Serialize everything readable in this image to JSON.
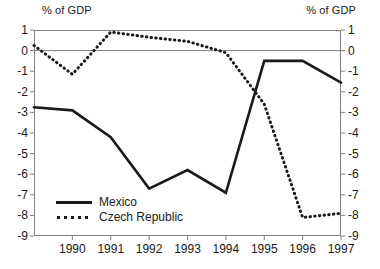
{
  "header": {
    "left_axis_title": "% of GDP",
    "right_axis_title": "% of GDP"
  },
  "legend": {
    "items": [
      {
        "label": "Mexico",
        "style": "solid",
        "key_name": "legend-key-solid"
      },
      {
        "label": "Czech Republic",
        "style": "dotted",
        "key_name": "legend-key-dotted"
      }
    ]
  },
  "axis": {
    "y_ticks": [
      "1",
      "0",
      "-1",
      "-2",
      "-3",
      "-4",
      "-5",
      "-6",
      "-7",
      "-8",
      "-9"
    ],
    "x_ticks": [
      "1990",
      "1991",
      "1992",
      "1993",
      "1994",
      "1995",
      "1996",
      "1997"
    ]
  },
  "chart_data": {
    "type": "line",
    "title": "",
    "subtitle": "",
    "xlabel": "",
    "ylabel": "% of GDP",
    "y2label": "% of GDP",
    "ylim": [
      -9,
      1
    ],
    "y_ticks": [
      1,
      0,
      -1,
      -2,
      -3,
      -4,
      -5,
      -6,
      -7,
      -8,
      -9
    ],
    "grid": false,
    "zero_line": true,
    "legend_position": "inside-lower-left",
    "x": [
      1989,
      1990,
      1991,
      1992,
      1993,
      1994,
      1995,
      1996,
      1997
    ],
    "x_tick_labels": [
      "1990",
      "1991",
      "1992",
      "1993",
      "1994",
      "1995",
      "1996",
      "1997"
    ],
    "series": [
      {
        "name": "Mexico",
        "style": "solid",
        "color": "#1a1a1a",
        "values": [
          -2.75,
          -2.9,
          -4.2,
          -6.7,
          -5.8,
          -6.9,
          -0.5,
          -0.5,
          -1.55
        ]
      },
      {
        "name": "Czech Republic",
        "style": "dotted",
        "color": "#1a1a1a",
        "values": [
          0.25,
          -1.15,
          0.9,
          0.65,
          0.45,
          -0.1,
          -2.6,
          -8.1,
          -7.9
        ]
      }
    ]
  }
}
